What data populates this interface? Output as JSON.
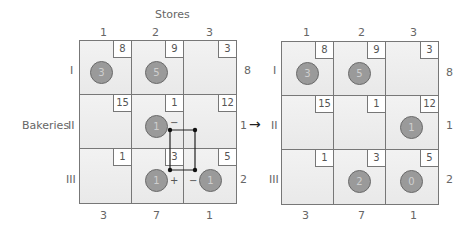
{
  "title": "Stores",
  "row_axis_label": "Bakeries",
  "store_labels": [
    "1",
    "2",
    "3"
  ],
  "bakery_labels": [
    "I",
    "II",
    "III"
  ],
  "left": {
    "costs": [
      [
        "8",
        "9",
        "3"
      ],
      [
        "15",
        "1",
        "12"
      ],
      [
        "1",
        "3",
        "5"
      ]
    ],
    "allocations": [
      [
        "3",
        "5",
        ""
      ],
      [
        "",
        "1",
        ""
      ],
      [
        "",
        "1",
        "1"
      ]
    ],
    "supply": [
      "8",
      "1",
      "2"
    ],
    "demand": [
      "3",
      "7",
      "1"
    ],
    "signs": {
      "r2c2": "−",
      "r2c3": "+",
      "r3c2": "+",
      "r3c3": "−"
    }
  },
  "arrow": "→",
  "right": {
    "costs": [
      [
        "8",
        "9",
        "3"
      ],
      [
        "15",
        "1",
        "12"
      ],
      [
        "1",
        "3",
        "5"
      ]
    ],
    "allocations": [
      [
        "3",
        "5",
        ""
      ],
      [
        "",
        "",
        "1"
      ],
      [
        "",
        "2",
        "0"
      ]
    ],
    "supply": [
      "8",
      "1",
      "2"
    ],
    "demand": [
      "3",
      "7",
      "1"
    ]
  }
}
